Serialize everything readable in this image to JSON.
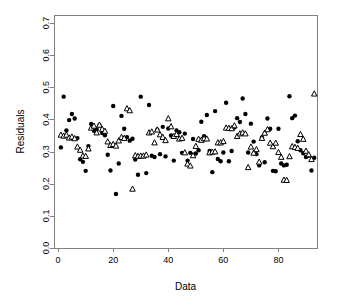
{
  "chart_data": {
    "type": "scatter",
    "title": "",
    "xlabel": "Data",
    "ylabel": "Residuals",
    "xlim": [
      -1.5,
      94
    ],
    "ylim": [
      0.0,
      0.725
    ],
    "grid": false,
    "legend": "none",
    "xticks": [
      0,
      20,
      40,
      60,
      80
    ],
    "xtick_labels": [
      "0",
      "20",
      "40",
      "60",
      "80"
    ],
    "yticks": [
      0.0,
      0.1,
      0.2,
      0.3,
      0.4,
      0.5,
      0.6,
      0.7
    ],
    "ytick_labels": [
      "0.0",
      "0.1",
      "0.2",
      "0.3",
      "0.4",
      "0.5",
      "0.6",
      "0.7"
    ],
    "marker_colors": {
      "circles": "#000000",
      "triangles_fill": "#ffffff",
      "triangles_edge": "#000000",
      "frame": "#808080"
    },
    "series": [
      {
        "name": "observed",
        "marker": "filled-circle",
        "x": [
          1,
          2,
          3,
          4,
          5,
          6,
          7,
          8,
          9,
          10,
          11,
          12,
          13,
          14,
          15,
          16,
          17,
          18,
          19,
          20,
          21,
          22,
          23,
          24,
          25,
          26,
          27,
          28,
          29,
          30,
          31,
          32,
          33,
          34,
          35,
          36,
          37,
          38,
          39,
          40,
          41,
          42,
          43,
          44,
          45,
          46,
          47,
          48,
          49,
          50,
          51,
          52,
          53,
          54,
          55,
          56,
          57,
          58,
          59,
          60,
          61,
          62,
          63,
          64,
          65,
          66,
          67,
          68,
          69,
          70,
          71,
          72,
          73,
          74,
          75,
          76,
          77,
          78,
          79,
          80,
          81,
          82,
          83,
          84,
          85,
          86,
          87,
          88,
          89,
          90,
          91,
          92,
          93
        ],
        "y": [
          0.313,
          0.471,
          0.366,
          0.398,
          0.417,
          0.403,
          0.342,
          0.276,
          0.268,
          0.24,
          0.317,
          0.386,
          0.365,
          0.369,
          0.382,
          0.358,
          0.351,
          0.29,
          0.241,
          0.442,
          0.168,
          0.263,
          0.411,
          0.371,
          0.345,
          0.334,
          0.34,
          0.275,
          0.228,
          0.471,
          0.286,
          0.233,
          0.445,
          0.287,
          0.283,
          0.368,
          0.292,
          0.377,
          0.285,
          0.372,
          0.35,
          0.272,
          0.366,
          0.36,
          0.296,
          0.356,
          0.272,
          0.296,
          0.339,
          0.294,
          0.304,
          0.393,
          0.348,
          0.414,
          0.302,
          0.236,
          0.426,
          0.277,
          0.27,
          0.297,
          0.452,
          0.27,
          0.302,
          0.375,
          0.404,
          0.392,
          0.465,
          0.417,
          0.297,
          0.387,
          0.331,
          0.292,
          0.257,
          0.344,
          0.267,
          0.403,
          0.371,
          0.24,
          0.239,
          0.371,
          0.263,
          0.257,
          0.259,
          0.472,
          0.404,
          0.412,
          0.332,
          0.304,
          0.295,
          0.283,
          0.287,
          0.241,
          0.281
        ]
      },
      {
        "name": "fitted",
        "marker": "open-triangle",
        "x": [
          1,
          2,
          3,
          4,
          5,
          6,
          7,
          8,
          9,
          10,
          11,
          12,
          13,
          14,
          15,
          16,
          17,
          18,
          19,
          20,
          21,
          22,
          23,
          24,
          25,
          26,
          27,
          28,
          29,
          30,
          31,
          32,
          33,
          34,
          35,
          36,
          37,
          38,
          39,
          40,
          41,
          42,
          43,
          44,
          45,
          46,
          47,
          48,
          49,
          50,
          51,
          52,
          53,
          54,
          55,
          56,
          57,
          58,
          59,
          60,
          61,
          62,
          63,
          64,
          65,
          66,
          67,
          68,
          69,
          70,
          71,
          72,
          73,
          74,
          75,
          76,
          77,
          78,
          79,
          80,
          81,
          82,
          83,
          84,
          85,
          86,
          87,
          88,
          89,
          90,
          91,
          92,
          93
        ],
        "y": [
          0.352,
          0.349,
          0.352,
          0.343,
          0.346,
          0.341,
          0.315,
          0.305,
          0.287,
          0.286,
          0.309,
          0.374,
          0.38,
          0.359,
          0.383,
          0.37,
          0.364,
          0.331,
          0.32,
          0.323,
          0.318,
          0.334,
          0.345,
          0.342,
          0.434,
          0.428,
          0.184,
          0.288,
          0.286,
          0.287,
          0.287,
          0.29,
          0.359,
          0.362,
          0.328,
          0.368,
          0.353,
          0.345,
          0.335,
          0.403,
          0.378,
          0.348,
          0.354,
          0.34,
          0.342,
          0.297,
          0.262,
          0.256,
          0.288,
          0.317,
          0.339,
          0.336,
          0.341,
          0.34,
          0.297,
          0.299,
          0.3,
          0.328,
          0.328,
          0.332,
          0.374,
          0.373,
          0.372,
          0.381,
          0.348,
          0.356,
          0.359,
          0.356,
          0.251,
          0.315,
          0.296,
          0.307,
          0.268,
          0.342,
          0.358,
          0.369,
          0.327,
          0.316,
          0.327,
          0.298,
          0.283,
          0.212,
          0.211,
          0.285,
          0.316,
          0.314,
          0.311,
          0.354,
          0.339,
          0.302,
          0.291,
          0.276,
          0.48
        ]
      }
    ]
  }
}
